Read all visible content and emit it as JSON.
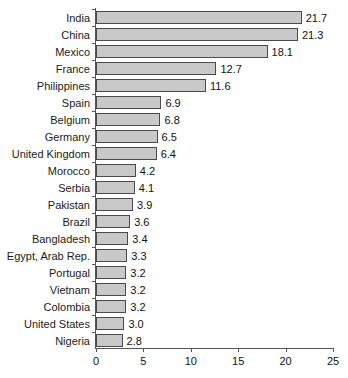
{
  "chart_data": {
    "type": "bar",
    "orientation": "horizontal",
    "title": "",
    "subtitle": "",
    "xlabel": "",
    "ylabel": "",
    "xlim": [
      0,
      25
    ],
    "xticks": [
      0,
      5,
      10,
      15,
      20,
      25
    ],
    "xtick_labels": [
      "0",
      "5",
      "10",
      "15",
      "20",
      "25"
    ],
    "grid": false,
    "legend": null,
    "bar_color": "#c9c9c9",
    "bar_border_color": "#4a4a4a",
    "axis_color": "#555555",
    "categories": [
      "India",
      "China",
      "Mexico",
      "France",
      "Philippines",
      "Spain",
      "Belgium",
      "Germany",
      "United Kingdom",
      "Morocco",
      "Serbia",
      "Pakistan",
      "Brazil",
      "Bangladesh",
      "Egypt, Arab Rep.",
      "Portugal",
      "Vietnam",
      "Colombia",
      "United States",
      "Nigeria"
    ],
    "values": [
      21.7,
      21.3,
      18.1,
      12.7,
      11.6,
      6.9,
      6.8,
      6.5,
      6.4,
      4.2,
      4.1,
      3.9,
      3.6,
      3.4,
      3.3,
      3.2,
      3.2,
      3.2,
      3.0,
      2.8
    ],
    "value_labels": [
      "21.7",
      "21.3",
      "18.1",
      "12.7",
      "11.6",
      "6.9",
      "6.8",
      "6.5",
      "6.4",
      "4.2",
      "4.1",
      "3.9",
      "3.6",
      "3.4",
      "3.3",
      "3.2",
      "3.2",
      "3.2",
      "3.0",
      "2.8"
    ]
  }
}
